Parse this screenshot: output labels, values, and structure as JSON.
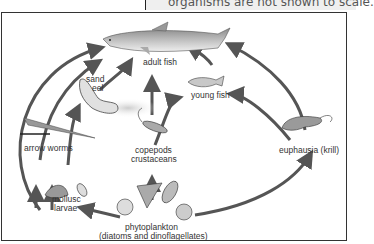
{
  "caption": "organisms are not shown to scale.",
  "diagram": {
    "labels": {
      "adult_fish": "adult fish",
      "sand_eel_1": "sand",
      "sand_eel_2": "eel",
      "young_fish": "young fish",
      "arrow_worms": "arrow worms",
      "copepods_1": "copepods",
      "copepods_2": "crustaceans",
      "krill": "euphausia (krill)",
      "mollusc_1": "mollusc",
      "mollusc_2": "larvae",
      "phyto_1": "phytoplankton",
      "phyto_2": "(diatoms and dinoflagellates)"
    },
    "nodes": [
      "adult fish",
      "sand eel",
      "young fish",
      "arrow worms",
      "copepods crustaceans",
      "euphausia (krill)",
      "mollusc larvae",
      "phytoplankton (diatoms and dinoflagellates)"
    ],
    "edges": [
      [
        "phytoplankton",
        "mollusc larvae"
      ],
      [
        "phytoplankton",
        "copepods crustaceans"
      ],
      [
        "phytoplankton",
        "euphausia (krill)"
      ],
      [
        "mollusc larvae",
        "arrow worms"
      ],
      [
        "mollusc larvae",
        "adult fish"
      ],
      [
        "arrow worms",
        "adult fish"
      ],
      [
        "arrow worms",
        "sand eel"
      ],
      [
        "sand eel",
        "adult fish"
      ],
      [
        "copepods crustaceans",
        "adult fish"
      ],
      [
        "copepods crustaceans",
        "young fish"
      ],
      [
        "young fish",
        "adult fish"
      ],
      [
        "euphausia (krill)",
        "young fish"
      ],
      [
        "euphausia (krill)",
        "adult fish"
      ]
    ],
    "colors": {
      "arrow": "#555555",
      "frame": "#333333",
      "caption_bg": "#efefef"
    }
  }
}
